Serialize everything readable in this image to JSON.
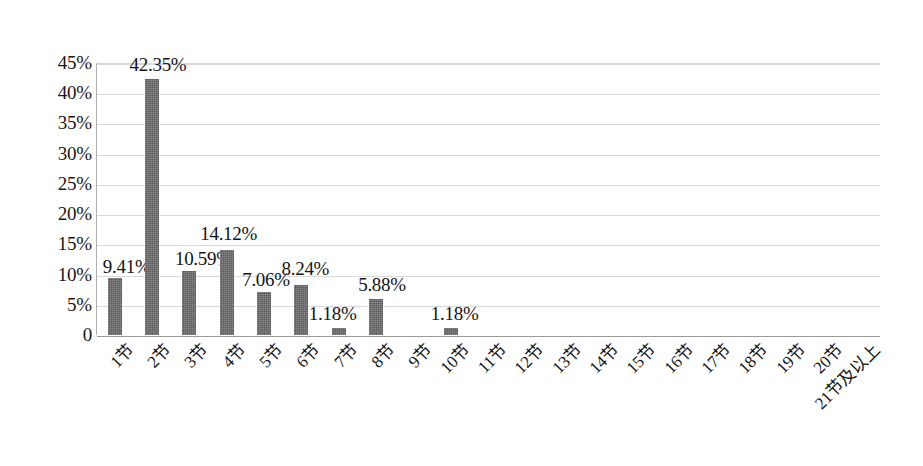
{
  "chart_data": {
    "type": "bar",
    "title": "",
    "subtitle": "",
    "xlabel": "",
    "ylabel": "",
    "categories": [
      "1节",
      "2节",
      "3节",
      "4节",
      "5节",
      "6节",
      "7节",
      "8节",
      "9节",
      "10节",
      "11节",
      "12节",
      "13节",
      "14节",
      "15节",
      "16节",
      "17节",
      "18节",
      "19节",
      "20节",
      "21节及以上"
    ],
    "values": [
      9.41,
      42.35,
      10.59,
      14.12,
      7.06,
      8.24,
      1.18,
      5.88,
      0,
      1.18,
      0,
      0,
      0,
      0,
      0,
      0,
      0,
      0,
      0,
      0,
      0
    ],
    "data_labels": [
      "9.41%",
      "42.35%",
      "10.59%",
      "14.12%",
      "7.06%",
      "8.24%",
      "1.18%",
      "5.88%",
      "",
      "1.18%",
      "",
      "",
      "",
      "",
      "",
      "",
      "",
      "",
      "",
      "",
      ""
    ],
    "ylim": [
      0,
      45
    ],
    "ytick_values": [
      0,
      5,
      10,
      15,
      20,
      25,
      30,
      35,
      40,
      45
    ],
    "ytick_labels": [
      "0",
      "5%",
      "10%",
      "15%",
      "20%",
      "25%",
      "30%",
      "35%",
      "40%",
      "45%"
    ],
    "grid": true,
    "legend": false,
    "legend_position": "none",
    "bar_color": "#5b5b5b",
    "gridline_color": "#d9d9d9",
    "axis_color": "#9a9a9a",
    "label_rotation": -45
  }
}
